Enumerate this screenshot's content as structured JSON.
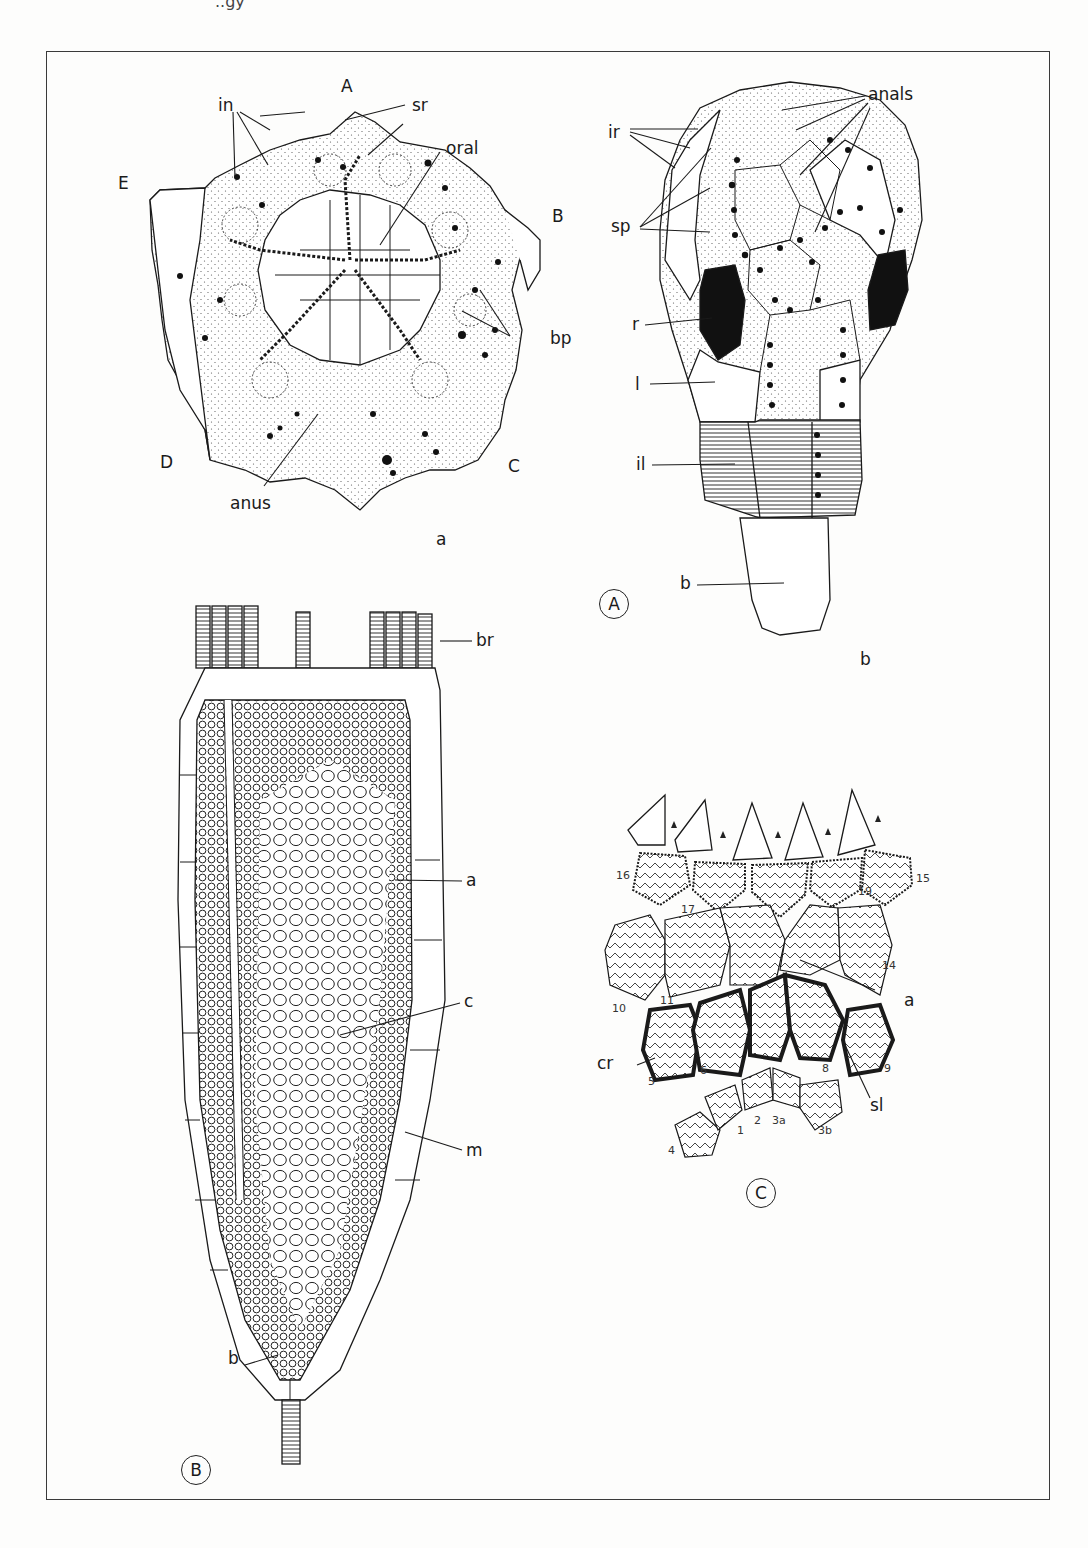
{
  "plate": {
    "header_fragment": "..gy"
  },
  "figure_A": {
    "badge": "A",
    "part_a": {
      "sublabel": "a",
      "ambulacra": [
        "A",
        "B",
        "C",
        "D",
        "E"
      ],
      "labels": {
        "in": "in",
        "sr": "sr",
        "oral": "oral",
        "bp": "bp",
        "anus": "anus"
      }
    },
    "part_b": {
      "sublabel": "b",
      "labels": {
        "ir": "ir",
        "sp": "sp",
        "anals": "anals",
        "r": "r",
        "l": "l",
        "il": "il",
        "b": "b"
      }
    }
  },
  "figure_B": {
    "badge": "B",
    "labels": {
      "br": "br",
      "a": "a",
      "c": "c",
      "m": "m",
      "b": "b"
    }
  },
  "figure_C": {
    "badge": "C",
    "labels": {
      "a": "a",
      "cr": "cr",
      "sl": "sl"
    },
    "plate_numbers": [
      "16",
      "17",
      "19",
      "15",
      "10",
      "11",
      "14",
      "5",
      "6",
      "8",
      "9",
      "1",
      "2",
      "3a",
      "3b",
      "4"
    ]
  }
}
